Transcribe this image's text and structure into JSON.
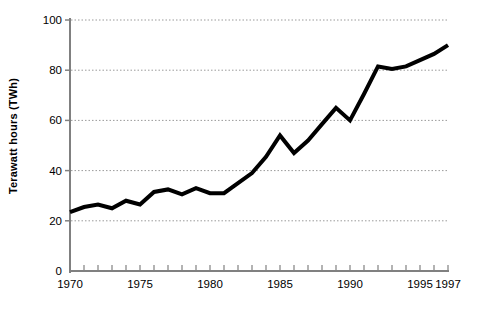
{
  "chart_data": {
    "type": "line",
    "title": "",
    "subtitle": "",
    "xlabel": "",
    "ylabel": "Terawatt hours (TWh)",
    "xlim": [
      1970,
      1997
    ],
    "ylim": [
      0,
      100
    ],
    "grid": true,
    "grid_orientation": "horizontal",
    "grid_style": "dotted",
    "legend": false,
    "legend_position": "none",
    "line_color": "#000000",
    "line_width": 4,
    "axis_color": "#808080",
    "yticks": [
      0,
      20,
      40,
      60,
      80,
      100
    ],
    "ytick_labels": [
      "0",
      "20",
      "40",
      "60",
      "80",
      "100"
    ],
    "xticks": [
      1970,
      1975,
      1980,
      1985,
      1990,
      1995,
      1997
    ],
    "xtick_labels": [
      "1970",
      "1975",
      "1980",
      "1985",
      "1990",
      "1995",
      "1997"
    ],
    "x_minor_tick_interval": 1,
    "x": [
      1970,
      1971,
      1972,
      1973,
      1974,
      1975,
      1976,
      1977,
      1978,
      1979,
      1980,
      1981,
      1982,
      1983,
      1984,
      1985,
      1986,
      1987,
      1988,
      1989,
      1990,
      1991,
      1992,
      1993,
      1994,
      1995,
      1996,
      1997
    ],
    "values": [
      23.5,
      25.5,
      26.5,
      25.0,
      28.0,
      26.5,
      31.5,
      32.5,
      30.5,
      33.0,
      31.0,
      31.0,
      35.0,
      39.0,
      45.5,
      54.0,
      47.0,
      52.0,
      58.5,
      65.0,
      60.0,
      70.5,
      81.5,
      80.5,
      81.5,
      84.0,
      86.5,
      90.0
    ],
    "series": [
      {
        "name": "Terawatt hours (TWh)",
        "values": [
          23.5,
          25.5,
          26.5,
          25.0,
          28.0,
          26.5,
          31.5,
          32.5,
          30.5,
          33.0,
          31.0,
          31.0,
          35.0,
          39.0,
          45.5,
          54.0,
          47.0,
          52.0,
          58.5,
          65.0,
          60.0,
          70.5,
          81.5,
          80.5,
          81.5,
          84.0,
          86.5,
          90.0
        ]
      }
    ],
    "annotations": []
  },
  "geometry": {
    "plot_left": 70,
    "plot_right": 448,
    "plot_top": 20,
    "plot_bottom": 271
  }
}
